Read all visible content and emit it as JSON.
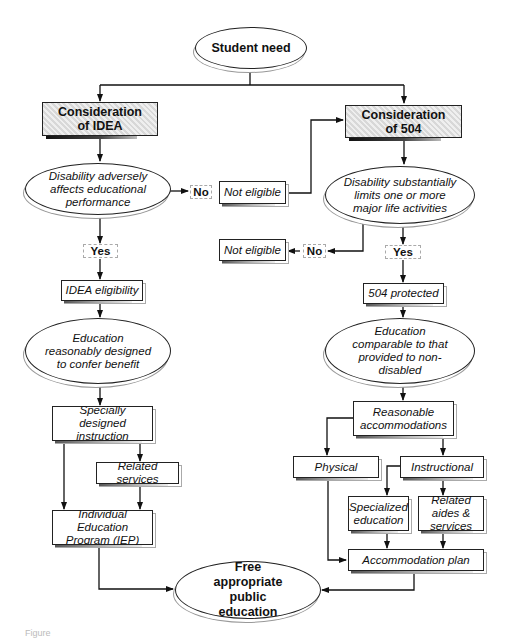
{
  "diagram": {
    "type": "flowchart",
    "nodes": {
      "student_need": "Student need",
      "consideration_idea": "Consideration of IDEA",
      "consideration_504": "Consideration of 504",
      "idea_question": "Disability adversely affects educational performance",
      "section504_question": "Disability substantially limits one or more major life activities",
      "not_eligible_top": "Not eligible",
      "not_eligible_bottom": "Not eligible",
      "idea_eligibility": "IDEA eligibility",
      "protected_504": "504 protected",
      "idea_standard": "Education reasonably designed to confer benefit",
      "standard_504": "Education comparable to that provided to non-disabled",
      "specially_designed": "Specially designed instruction",
      "related_services": "Related services",
      "iep": "Individual Education Program (IEP)",
      "reasonable_accommodations": "Reasonable accommodations",
      "physical": "Physical",
      "instructional": "Instructional",
      "specialized_education": "Specialized education",
      "related_aides": "Related aides & services",
      "accommodation_plan": "Accommodation plan",
      "fape": "Free appropriate public education"
    },
    "labels": {
      "no_idea": "No",
      "yes_idea": "Yes",
      "no_504": "No",
      "yes_504": "Yes"
    },
    "edges": [
      [
        "student_need",
        "consideration_idea"
      ],
      [
        "student_need",
        "consideration_504"
      ],
      [
        "consideration_idea",
        "idea_question"
      ],
      [
        "idea_question",
        "not_eligible_top",
        "No"
      ],
      [
        "not_eligible_top",
        "consideration_504"
      ],
      [
        "idea_question",
        "idea_eligibility",
        "Yes"
      ],
      [
        "consideration_504",
        "section504_question"
      ],
      [
        "section504_question",
        "not_eligible_bottom",
        "No"
      ],
      [
        "section504_question",
        "protected_504",
        "Yes"
      ],
      [
        "idea_eligibility",
        "idea_standard"
      ],
      [
        "idea_standard",
        "specially_designed"
      ],
      [
        "specially_designed",
        "related_services"
      ],
      [
        "specially_designed",
        "iep"
      ],
      [
        "related_services",
        "iep"
      ],
      [
        "iep",
        "fape"
      ],
      [
        "protected_504",
        "standard_504"
      ],
      [
        "standard_504",
        "reasonable_accommodations"
      ],
      [
        "reasonable_accommodations",
        "physical"
      ],
      [
        "reasonable_accommodations",
        "instructional"
      ],
      [
        "instructional",
        "specialized_education"
      ],
      [
        "instructional",
        "related_aides"
      ],
      [
        "physical",
        "accommodation_plan"
      ],
      [
        "specialized_education",
        "accommodation_plan"
      ],
      [
        "related_aides",
        "accommodation_plan"
      ],
      [
        "accommodation_plan",
        "fape"
      ]
    ]
  },
  "caption": "Figure"
}
